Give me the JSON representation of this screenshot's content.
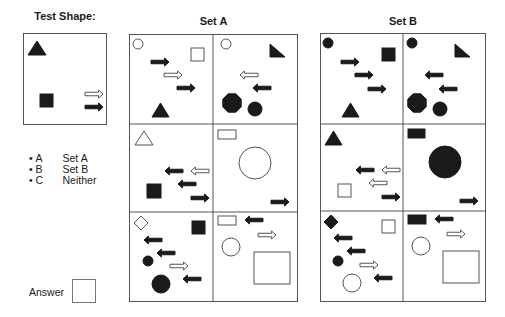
{
  "headings": {
    "test_shape": "Test Shape:",
    "set_a": "Set A",
    "set_b": "Set B"
  },
  "options": [
    {
      "bullet": "•",
      "key": "A",
      "label": "Set A"
    },
    {
      "bullet": "•",
      "key": "B",
      "label": "Set B"
    },
    {
      "bullet": "•",
      "key": "C",
      "label": "Neither"
    }
  ],
  "answer": {
    "label": "Answer",
    "value": ""
  },
  "colors": {
    "fill": "#1a1a1a",
    "stroke": "#555555",
    "background": "#ffffff"
  },
  "test_shape": {
    "box": [
      23,
      33,
      84,
      92
    ],
    "shapes": [
      {
        "type": "triangle",
        "fill": true,
        "x": 28,
        "y": 41,
        "w": 18,
        "h": 14
      },
      {
        "type": "square",
        "fill": true,
        "x": 40,
        "y": 94,
        "w": 13,
        "h": 13
      },
      {
        "type": "arrow",
        "dir": "right",
        "fill": false,
        "x": 85,
        "y": 90,
        "w": 18,
        "h": 8
      },
      {
        "type": "arrow",
        "dir": "right",
        "fill": true,
        "x": 85,
        "y": 103,
        "w": 18,
        "h": 8
      }
    ]
  },
  "set_a": {
    "box": [
      129,
      34,
      169,
      268
    ],
    "dividers": {
      "v": 213,
      "h": [
        124,
        212
      ]
    },
    "shapes": [
      {
        "type": "circle",
        "fill": false,
        "cx": 138,
        "cy": 44,
        "r": 5
      },
      {
        "type": "arrow",
        "dir": "right",
        "fill": true,
        "x": 151,
        "y": 58,
        "w": 18,
        "h": 8
      },
      {
        "type": "square",
        "fill": false,
        "x": 191,
        "y": 48,
        "w": 13,
        "h": 13
      },
      {
        "type": "arrow",
        "dir": "right",
        "fill": false,
        "x": 164,
        "y": 71,
        "w": 18,
        "h": 8
      },
      {
        "type": "arrow",
        "dir": "right",
        "fill": true,
        "x": 177,
        "y": 84,
        "w": 18,
        "h": 8
      },
      {
        "type": "triangle",
        "fill": true,
        "x": 152,
        "y": 103,
        "w": 17,
        "h": 14
      },
      {
        "type": "circle",
        "fill": false,
        "cx": 226,
        "cy": 44,
        "r": 5
      },
      {
        "type": "rtriangle",
        "fill": true,
        "x": 270,
        "y": 44,
        "w": 15,
        "h": 13
      },
      {
        "type": "arrow",
        "dir": "left",
        "fill": false,
        "x": 240,
        "y": 71,
        "w": 18,
        "h": 8
      },
      {
        "type": "arrow",
        "dir": "left",
        "fill": true,
        "x": 253,
        "y": 84,
        "w": 18,
        "h": 8
      },
      {
        "type": "octagon",
        "fill": true,
        "cx": 232,
        "cy": 103,
        "r": 10
      },
      {
        "type": "circle",
        "fill": true,
        "cx": 255,
        "cy": 109,
        "r": 7
      },
      {
        "type": "triangle",
        "fill": false,
        "x": 135,
        "y": 131,
        "w": 18,
        "h": 14
      },
      {
        "type": "arrow",
        "dir": "left",
        "fill": false,
        "x": 191,
        "y": 167,
        "w": 18,
        "h": 8
      },
      {
        "type": "arrow",
        "dir": "left",
        "fill": true,
        "x": 165,
        "y": 167,
        "w": 18,
        "h": 8
      },
      {
        "type": "arrow",
        "dir": "left",
        "fill": true,
        "x": 178,
        "y": 180,
        "w": 18,
        "h": 8
      },
      {
        "type": "square",
        "fill": true,
        "x": 147,
        "y": 184,
        "w": 14,
        "h": 14
      },
      {
        "type": "arrow",
        "dir": "right",
        "fill": true,
        "x": 191,
        "y": 194,
        "w": 18,
        "h": 8
      },
      {
        "type": "rect",
        "fill": false,
        "x": 218,
        "y": 130,
        "w": 18,
        "h": 9
      },
      {
        "type": "circle",
        "fill": false,
        "cx": 255,
        "cy": 163,
        "r": 16
      },
      {
        "type": "arrow",
        "dir": "right",
        "fill": true,
        "x": 271,
        "y": 198,
        "w": 18,
        "h": 8
      },
      {
        "type": "diamond",
        "fill": false,
        "cx": 141,
        "cy": 223,
        "r": 7
      },
      {
        "type": "square",
        "fill": true,
        "x": 192,
        "y": 221,
        "w": 13,
        "h": 13
      },
      {
        "type": "arrow",
        "dir": "left",
        "fill": true,
        "x": 144,
        "y": 236,
        "w": 18,
        "h": 8
      },
      {
        "type": "arrow",
        "dir": "left",
        "fill": true,
        "x": 157,
        "y": 249,
        "w": 18,
        "h": 8
      },
      {
        "type": "circle",
        "fill": true,
        "cx": 148,
        "cy": 261,
        "r": 5
      },
      {
        "type": "arrow",
        "dir": "right",
        "fill": false,
        "x": 170,
        "y": 262,
        "w": 18,
        "h": 8
      },
      {
        "type": "circle",
        "fill": true,
        "cx": 161,
        "cy": 284,
        "r": 9
      },
      {
        "type": "arrow",
        "dir": "left",
        "fill": true,
        "x": 183,
        "y": 275,
        "w": 18,
        "h": 8
      },
      {
        "type": "rect",
        "fill": false,
        "x": 218,
        "y": 216,
        "w": 18,
        "h": 9
      },
      {
        "type": "arrow",
        "dir": "left",
        "fill": true,
        "x": 245,
        "y": 216,
        "w": 18,
        "h": 8
      },
      {
        "type": "arrow",
        "dir": "right",
        "fill": false,
        "x": 258,
        "y": 231,
        "w": 18,
        "h": 8
      },
      {
        "type": "circle",
        "fill": false,
        "cx": 231,
        "cy": 247,
        "r": 9
      },
      {
        "type": "square",
        "fill": false,
        "x": 254,
        "y": 252,
        "w": 36,
        "h": 32
      }
    ]
  },
  "set_b": {
    "box": [
      320,
      33,
      166,
      269
    ],
    "dividers": {
      "v": 403,
      "h": [
        124,
        211
      ]
    },
    "shapes": [
      {
        "type": "circle",
        "fill": true,
        "cx": 328,
        "cy": 43,
        "r": 5
      },
      {
        "type": "square",
        "fill": true,
        "x": 382,
        "y": 48,
        "w": 13,
        "h": 13
      },
      {
        "type": "arrow",
        "dir": "right",
        "fill": true,
        "x": 341,
        "y": 58,
        "w": 18,
        "h": 8
      },
      {
        "type": "arrow",
        "dir": "right",
        "fill": true,
        "x": 355,
        "y": 71,
        "w": 18,
        "h": 8
      },
      {
        "type": "arrow",
        "dir": "right",
        "fill": true,
        "x": 368,
        "y": 85,
        "w": 18,
        "h": 8
      },
      {
        "type": "triangle",
        "fill": true,
        "x": 342,
        "y": 103,
        "w": 17,
        "h": 14
      },
      {
        "type": "circle",
        "fill": true,
        "cx": 412,
        "cy": 43,
        "r": 5
      },
      {
        "type": "rtriangle",
        "fill": true,
        "x": 455,
        "y": 44,
        "w": 15,
        "h": 13
      },
      {
        "type": "arrow",
        "dir": "left",
        "fill": true,
        "x": 425,
        "y": 71,
        "w": 18,
        "h": 8
      },
      {
        "type": "arrow",
        "dir": "left",
        "fill": true,
        "x": 439,
        "y": 85,
        "w": 18,
        "h": 8
      },
      {
        "type": "octagon",
        "fill": true,
        "cx": 417,
        "cy": 103,
        "r": 10
      },
      {
        "type": "circle",
        "fill": true,
        "cx": 440,
        "cy": 109,
        "r": 7
      },
      {
        "type": "triangle",
        "fill": true,
        "x": 325,
        "y": 131,
        "w": 17,
        "h": 14
      },
      {
        "type": "arrow",
        "dir": "left",
        "fill": false,
        "x": 382,
        "y": 166,
        "w": 18,
        "h": 8
      },
      {
        "type": "arrow",
        "dir": "left",
        "fill": true,
        "x": 356,
        "y": 166,
        "w": 18,
        "h": 8
      },
      {
        "type": "arrow",
        "dir": "left",
        "fill": false,
        "x": 369,
        "y": 179,
        "w": 18,
        "h": 8
      },
      {
        "type": "square",
        "fill": false,
        "x": 338,
        "y": 184,
        "w": 13,
        "h": 13
      },
      {
        "type": "arrow",
        "dir": "right",
        "fill": true,
        "x": 382,
        "y": 193,
        "w": 18,
        "h": 8
      },
      {
        "type": "rect",
        "fill": true,
        "x": 408,
        "y": 129,
        "w": 17,
        "h": 9
      },
      {
        "type": "circle",
        "fill": true,
        "cx": 445,
        "cy": 162,
        "r": 16
      },
      {
        "type": "arrow",
        "dir": "right",
        "fill": true,
        "x": 460,
        "y": 197,
        "w": 18,
        "h": 8
      },
      {
        "type": "diamond",
        "fill": true,
        "cx": 331,
        "cy": 222,
        "r": 7
      },
      {
        "type": "square",
        "fill": false,
        "x": 382,
        "y": 220,
        "w": 13,
        "h": 13
      },
      {
        "type": "arrow",
        "dir": "left",
        "fill": true,
        "x": 334,
        "y": 234,
        "w": 18,
        "h": 8
      },
      {
        "type": "arrow",
        "dir": "left",
        "fill": true,
        "x": 347,
        "y": 247,
        "w": 18,
        "h": 8
      },
      {
        "type": "circle",
        "fill": true,
        "cx": 338,
        "cy": 261,
        "r": 5
      },
      {
        "type": "arrow",
        "dir": "right",
        "fill": false,
        "x": 360,
        "y": 261,
        "w": 18,
        "h": 8
      },
      {
        "type": "circle",
        "fill": false,
        "cx": 352,
        "cy": 283,
        "r": 9
      },
      {
        "type": "arrow",
        "dir": "left",
        "fill": true,
        "x": 374,
        "y": 274,
        "w": 18,
        "h": 8
      },
      {
        "type": "rect",
        "fill": true,
        "x": 408,
        "y": 215,
        "w": 18,
        "h": 9
      },
      {
        "type": "arrow",
        "dir": "left",
        "fill": true,
        "x": 435,
        "y": 215,
        "w": 18,
        "h": 8
      },
      {
        "type": "arrow",
        "dir": "right",
        "fill": false,
        "x": 447,
        "y": 230,
        "w": 18,
        "h": 8
      },
      {
        "type": "circle",
        "fill": false,
        "cx": 421,
        "cy": 246,
        "r": 9
      },
      {
        "type": "square",
        "fill": false,
        "x": 443,
        "y": 251,
        "w": 36,
        "h": 32
      }
    ]
  }
}
